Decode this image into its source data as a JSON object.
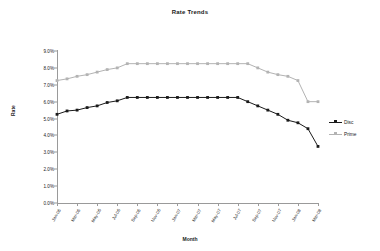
{
  "chart_data": {
    "type": "line",
    "title": "Rate Trends",
    "xlabel": "Month",
    "ylabel": "Rate",
    "ylim": [
      0,
      9
    ],
    "ytick_labels": [
      "9.0%",
      "8.0%",
      "7.0%",
      "6.0%",
      "5.0%",
      "4.0%",
      "3.0%",
      "2.0%",
      "1.0%",
      "0.0%"
    ],
    "ytick_values": [
      9,
      8,
      7,
      6,
      5,
      4,
      3,
      2,
      1,
      0
    ],
    "grid": false,
    "legend_position": "right",
    "x": [
      "Jan-06",
      "Feb-06",
      "Mar-06",
      "Apr-06",
      "May-06",
      "Jun-06",
      "Jul-06",
      "Aug-06",
      "Sep-06",
      "Oct-06",
      "Nov-06",
      "Dec-06",
      "Jan-07",
      "Feb-07",
      "Mar-07",
      "Apr-07",
      "May-07",
      "Jun-07",
      "Jul-07",
      "Aug-07",
      "Sep-07",
      "Oct-07",
      "Nov-07",
      "Dec-07",
      "Jan-08",
      "Feb-08",
      "Mar-08"
    ],
    "xtick_labels": [
      "Jan-06",
      "Mar-06",
      "May-06",
      "Jul-06",
      "Sep-06",
      "Nov-06",
      "Jan-07",
      "Mar-07",
      "May-07",
      "Jul-07",
      "Sep-07",
      "Nov-07",
      "Jan-08",
      "Mar-08"
    ],
    "xtick_indices": [
      0,
      2,
      4,
      6,
      8,
      10,
      12,
      14,
      16,
      18,
      20,
      22,
      24,
      26
    ],
    "series": [
      {
        "name": "Disc",
        "color": "#1a1a1a",
        "values": [
          5.25,
          5.45,
          5.5,
          5.65,
          5.75,
          5.95,
          6.05,
          6.25,
          6.25,
          6.25,
          6.25,
          6.25,
          6.25,
          6.25,
          6.25,
          6.25,
          6.25,
          6.25,
          6.25,
          6.0,
          5.75,
          5.5,
          5.25,
          4.9,
          4.75,
          4.4,
          3.35
        ]
      },
      {
        "name": "Prime",
        "color": "#b3b3b3",
        "values": [
          7.25,
          7.35,
          7.5,
          7.6,
          7.75,
          7.9,
          8.0,
          8.25,
          8.25,
          8.25,
          8.25,
          8.25,
          8.25,
          8.25,
          8.25,
          8.25,
          8.25,
          8.25,
          8.25,
          8.25,
          8.0,
          7.75,
          7.6,
          7.5,
          7.25,
          6.0,
          6.0
        ]
      }
    ]
  }
}
